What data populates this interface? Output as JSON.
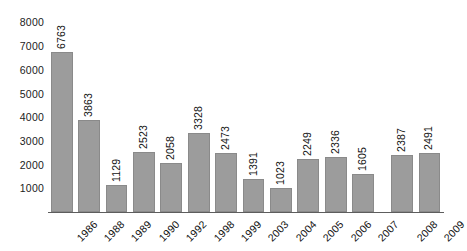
{
  "chart_data": {
    "type": "bar",
    "title": "",
    "subtitle": "",
    "xlabel": "",
    "ylabel": "",
    "categories": [
      "1986",
      "1988",
      "1989",
      "1990",
      "1992",
      "1998",
      "1999",
      "2003",
      "2004",
      "2005",
      "2006",
      "2007",
      "2008",
      "2009"
    ],
    "values": [
      6763,
      3863,
      1129,
      2523,
      2058,
      3328,
      2473,
      1391,
      1023,
      2249,
      2336,
      1605,
      2387,
      2491
    ],
    "value_labels": [
      "6763",
      "3863",
      "1129",
      "2523",
      "2058",
      "3328",
      "2473",
      "1391",
      "1023",
      "2249",
      "2336",
      "1605",
      "2387",
      "2491"
    ],
    "ylim": [
      0,
      8400
    ],
    "y_ticks": [
      1000,
      2000,
      3000,
      4000,
      5000,
      6000,
      7000,
      8000
    ],
    "y_tick_labels": [
      "1000",
      "2000",
      "3000",
      "4000",
      "5000",
      "6000",
      "7000",
      "8000"
    ],
    "grid": false,
    "legend": null,
    "legend_position": "none",
    "series": [
      {
        "name": "",
        "values": [
          6763,
          3863,
          1129,
          2523,
          2058,
          3328,
          2473,
          1391,
          1023,
          2249,
          2336,
          1605,
          2387,
          2491
        ]
      }
    ],
    "colors": {
      "bar_fill": "#9c9c9c",
      "bar_edge": "#8a8a8a",
      "axis_line": "#5d5d5d",
      "text": "#111111",
      "background": "#ffffff"
    },
    "value_label_rotation": -90,
    "category_label_rotation": -45
  }
}
